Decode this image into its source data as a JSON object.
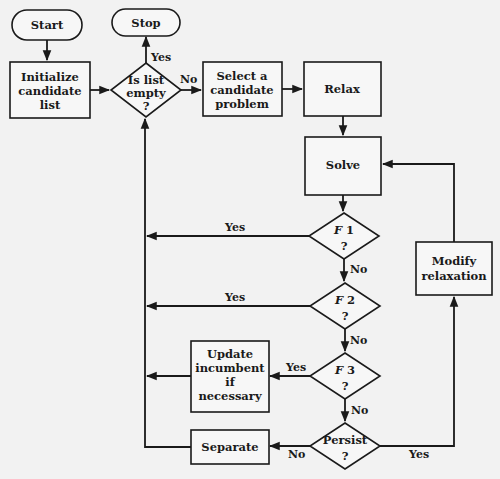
{
  "diagram": {
    "type": "flowchart",
    "nodes": {
      "start": {
        "label": "Start"
      },
      "stop": {
        "label": "Stop"
      },
      "init": {
        "lines": [
          "Initialize",
          "candidate",
          "list"
        ]
      },
      "empty": {
        "lines": [
          "Is list",
          "empty",
          "?"
        ]
      },
      "select": {
        "lines": [
          "Select a",
          "candidate",
          "problem"
        ]
      },
      "relax": {
        "label": "Relax"
      },
      "solve": {
        "label": "Solve"
      },
      "f1": {
        "var": "F",
        "num": "1",
        "q": "?"
      },
      "f2": {
        "var": "F",
        "num": "2",
        "q": "?"
      },
      "f3": {
        "var": "F",
        "num": "3",
        "q": "?"
      },
      "persist": {
        "lines": [
          "Persist",
          "?"
        ]
      },
      "modify": {
        "lines": [
          "Modify",
          "relaxation"
        ]
      },
      "update": {
        "lines": [
          "Update",
          "incumbent",
          "if",
          "necessary"
        ]
      },
      "separate": {
        "label": "Separate"
      }
    },
    "edge_labels": {
      "empty_yes": "Yes",
      "empty_no": "No",
      "f1_yes": "Yes",
      "f1_no": "No",
      "f2_yes": "Yes",
      "f2_no": "No",
      "f3_yes": "Yes",
      "f3_no": "No",
      "persist_no": "No",
      "persist_yes": "Yes"
    },
    "colors": {
      "line": "#1a1a1a",
      "background": "#f2f2f2"
    }
  }
}
